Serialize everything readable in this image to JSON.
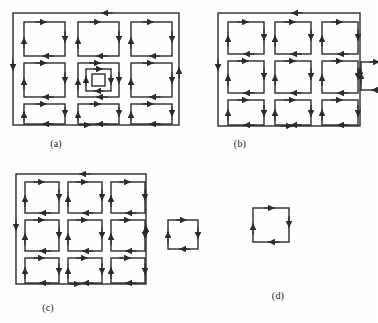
{
  "document": {
    "kind": "scanned-figure-plate",
    "background_color": "#fefefe",
    "ink_color": "#2b2b2b",
    "page_width": 377,
    "page_height": 323
  },
  "panels": [
    {
      "id": "a",
      "caption": "(a)",
      "description": "3 by 3 grid of clockwise directed square cycles enclosed by an outer directed boundary cycle, with an additional nested square cycle drawn inside the centre cell",
      "grid": {
        "rows": 3,
        "cols": 3
      },
      "has_outer_boundary": true,
      "has_nested_center_square": true,
      "satellite_square": null
    },
    {
      "id": "b",
      "caption": "(b)",
      "description": "3 by 3 grid of clockwise directed square cycles enclosed by an outer directed boundary cycle, with one small directed square cycle attached to the right boundary edge",
      "grid": {
        "rows": 3,
        "cols": 3
      },
      "has_outer_boundary": true,
      "has_nested_center_square": false,
      "satellite_square": {
        "position": "attached-right-edge",
        "size": "small"
      }
    },
    {
      "id": "c",
      "caption": "(c)",
      "description": "3 by 3 grid of clockwise directed square cycles enclosed by an outer directed boundary cycle, with one small directed square cycle detached and placed to the right",
      "grid": {
        "rows": 3,
        "cols": 3
      },
      "has_outer_boundary": true,
      "has_nested_center_square": false,
      "satellite_square": {
        "position": "detached-right",
        "size": "small"
      }
    },
    {
      "id": "d",
      "caption": "(d)",
      "description": "A single small directed square cycle on its own",
      "grid": null,
      "has_outer_boundary": false,
      "has_nested_center_square": false,
      "satellite_square": {
        "position": "standalone",
        "size": "small"
      }
    }
  ],
  "cycle_geometry": {
    "orientation": "clockwise",
    "edge_arrow_directions": {
      "top": "right",
      "right": "down",
      "bottom": "left",
      "left": "up"
    },
    "boundary_arrow_directions": {
      "top": "left",
      "right": "up",
      "bottom": "right",
      "left": "down"
    },
    "stroke_width_px": 1.4,
    "arrowhead_length_px": 6
  },
  "scan_artifacts": {
    "faint_text_rows": [
      "",
      "",
      ""
    ]
  }
}
